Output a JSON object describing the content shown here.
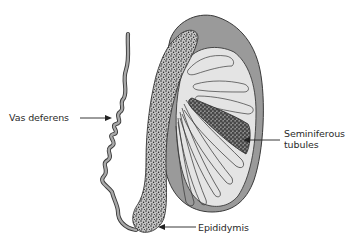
{
  "diagram": {
    "labels": {
      "vas_deferens": "Vas deferens",
      "seminiferous_line1": "Seminiferous",
      "seminiferous_line2": "tubules",
      "epididymis": "Epididymis"
    },
    "colors": {
      "outline": "#3a3a3a",
      "tunica_fill": "#9a9a9a",
      "lobule_fill": "#e6e6e6",
      "stipple_fill": "#bdbdbd",
      "stipple_dots": "#1e1e1e",
      "vas_fill": "#a8a8a8",
      "background": "#ffffff"
    }
  }
}
